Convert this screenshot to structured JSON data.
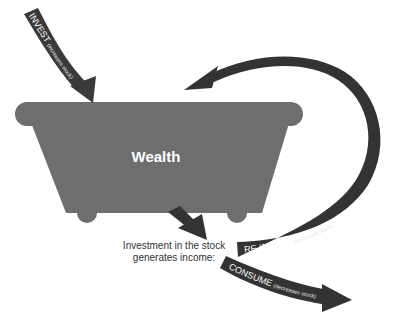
{
  "diagram": {
    "stock": {
      "label": "Wealth",
      "shape": "bathtub",
      "color": "#6e6e6e"
    },
    "arrows": {
      "invest": {
        "main": "INVEST",
        "sub": "(increases stock)",
        "color": "#3a3a3a"
      },
      "reinvest": {
        "main": "RE-INVEST",
        "sub": "(increases stock)",
        "color": "#333333"
      },
      "consume": {
        "main": "CONSUME",
        "sub": "(decreases stock)",
        "color": "#333333"
      }
    },
    "caption": {
      "line1": "Investment in the stock",
      "line2": "generates income:"
    }
  }
}
